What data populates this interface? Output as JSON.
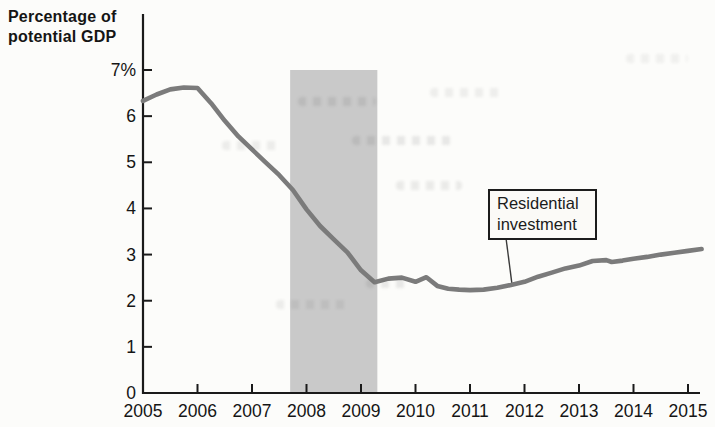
{
  "chart_data": {
    "type": "line",
    "title": "Percentage of\npotential GDP",
    "xlabel": "",
    "ylabel": "Percentage of potential GDP",
    "x_tick_labels": [
      "2005",
      "2006",
      "2007",
      "2008",
      "2009",
      "2010",
      "2011",
      "2012",
      "2013",
      "2014",
      "2015"
    ],
    "x_tick_years": [
      2005,
      2006,
      2007,
      2008,
      2009,
      2010,
      2011,
      2012,
      2013,
      2014,
      2015
    ],
    "y_tick_labels": [
      "0",
      "1",
      "2",
      "3",
      "4",
      "5",
      "6",
      "7%"
    ],
    "y_tick_values": [
      0,
      1,
      2,
      3,
      4,
      5,
      6,
      7
    ],
    "xlim": [
      2005,
      2015.3
    ],
    "ylim": [
      0,
      7
    ],
    "grid": false,
    "legend_position": "none",
    "recession_band": {
      "x_start": 2007.7,
      "x_end": 2009.3,
      "color": "#c9c9c9"
    },
    "annotation": {
      "label": "Residential investment",
      "pointer_to": {
        "x": 2011.77,
        "y": 2.36
      }
    },
    "colors": {
      "line": "#7b7b7b",
      "axis": "#1a1a1a",
      "text": "#151515",
      "callout_border": "#1c1c1c",
      "callout_bg": "#fbfaf7"
    },
    "series": [
      {
        "name": "Residential investment",
        "points": [
          [
            2005.0,
            6.33
          ],
          [
            2005.25,
            6.47
          ],
          [
            2005.5,
            6.58
          ],
          [
            2005.75,
            6.62
          ],
          [
            2006.0,
            6.61
          ],
          [
            2006.25,
            6.28
          ],
          [
            2006.5,
            5.9
          ],
          [
            2006.75,
            5.56
          ],
          [
            2007.0,
            5.28
          ],
          [
            2007.25,
            5.0
          ],
          [
            2007.5,
            4.72
          ],
          [
            2007.75,
            4.4
          ],
          [
            2008.0,
            3.98
          ],
          [
            2008.25,
            3.62
          ],
          [
            2008.5,
            3.33
          ],
          [
            2008.75,
            3.05
          ],
          [
            2009.0,
            2.66
          ],
          [
            2009.25,
            2.4
          ],
          [
            2009.5,
            2.48
          ],
          [
            2009.75,
            2.5
          ],
          [
            2010.0,
            2.41
          ],
          [
            2010.2,
            2.51
          ],
          [
            2010.4,
            2.32
          ],
          [
            2010.6,
            2.26
          ],
          [
            2010.8,
            2.24
          ],
          [
            2011.0,
            2.23
          ],
          [
            2011.25,
            2.24
          ],
          [
            2011.5,
            2.28
          ],
          [
            2011.75,
            2.34
          ],
          [
            2012.0,
            2.41
          ],
          [
            2012.25,
            2.52
          ],
          [
            2012.5,
            2.61
          ],
          [
            2012.75,
            2.7
          ],
          [
            2013.0,
            2.76
          ],
          [
            2013.25,
            2.86
          ],
          [
            2013.5,
            2.88
          ],
          [
            2013.6,
            2.84
          ],
          [
            2013.8,
            2.87
          ],
          [
            2014.0,
            2.91
          ],
          [
            2014.25,
            2.95
          ],
          [
            2014.5,
            3.0
          ],
          [
            2014.75,
            3.04
          ],
          [
            2015.0,
            3.08
          ],
          [
            2015.25,
            3.12
          ]
        ]
      }
    ]
  }
}
